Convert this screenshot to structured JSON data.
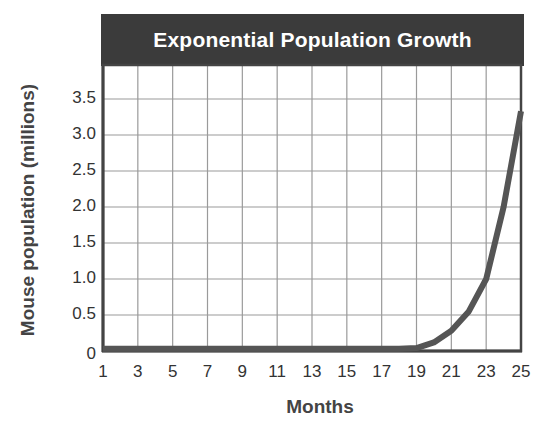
{
  "chart_data": {
    "type": "line",
    "title": "Exponential Population Growth",
    "xlabel": "Months",
    "ylabel": "Mouse population (millions)",
    "x_ticks": [
      "1",
      "3",
      "5",
      "7",
      "9",
      "11",
      "13",
      "15",
      "17",
      "19",
      "21",
      "23",
      "25"
    ],
    "y_ticks": [
      "0",
      "0.5",
      "1.0",
      "1.5",
      "2.0",
      "2.5",
      "3.0",
      "3.5"
    ],
    "xlim": [
      1,
      25
    ],
    "ylim": [
      0,
      4.0
    ],
    "grid": true,
    "legend": null,
    "series": [
      {
        "name": "Mouse population",
        "x": [
          1,
          3,
          5,
          7,
          9,
          11,
          13,
          15,
          17,
          18,
          19,
          20,
          21,
          22,
          23,
          24,
          25
        ],
        "y": [
          0.03,
          0.03,
          0.03,
          0.03,
          0.03,
          0.03,
          0.03,
          0.03,
          0.03,
          0.03,
          0.04,
          0.12,
          0.28,
          0.55,
          1.0,
          2.0,
          3.33
        ]
      }
    ]
  },
  "colors": {
    "title_bg": "#3b3b3b",
    "title_text": "#ffffff",
    "curve": "#555555",
    "grid": "#9a9a9a",
    "axis": "#444444"
  }
}
